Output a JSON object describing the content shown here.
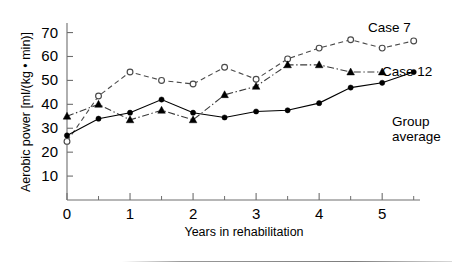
{
  "chart_data": {
    "type": "line",
    "title": "",
    "xlabel": "Years in rehabilitation",
    "ylabel": "Aerobic power [ml/(kg • min)]",
    "xlim": [
      0,
      5.6
    ],
    "ylim": [
      0,
      74
    ],
    "yticks": [
      10,
      20,
      30,
      40,
      50,
      60,
      70
    ],
    "xticks": [
      0,
      1,
      2,
      3,
      4,
      5
    ],
    "x_minor_ticks": [
      0.5,
      1.5,
      2.5,
      3.5,
      4.5,
      5.5
    ],
    "grid": false,
    "legend_position": "inline-right",
    "x": [
      0,
      0.5,
      1,
      1.5,
      2,
      2.5,
      3,
      3.5,
      4,
      4.5,
      5,
      5.5
    ],
    "series": [
      {
        "name": "Case 7",
        "marker": "open-circle",
        "linestyle": "dashed",
        "color": "#4a4a4a",
        "values": [
          24.5,
          43.5,
          53.5,
          50.0,
          48.5,
          55.5,
          50.5,
          59.0,
          63.5,
          67.0,
          63.5,
          66.5
        ]
      },
      {
        "name": "Case 12",
        "marker": "filled-triangle",
        "linestyle": "dash-dot",
        "color": "#3a3a3a",
        "values": [
          35.0,
          40.0,
          33.5,
          37.5,
          33.5,
          44.0,
          47.5,
          56.5,
          56.5,
          53.5,
          53.5,
          null
        ]
      },
      {
        "name": "Group average",
        "marker": "filled-circle",
        "linestyle": "solid",
        "color": "#000000",
        "values": [
          27.0,
          34.0,
          36.5,
          42.0,
          36.5,
          34.5,
          37.0,
          37.5,
          40.5,
          47.0,
          49.0,
          53.5
        ]
      }
    ],
    "annotations": [
      {
        "text": "Case 7",
        "x_px": 368,
        "y_px": 22
      },
      {
        "text": "Case 12",
        "x_px": 382,
        "y_px": 66
      },
      {
        "text": "Group",
        "x_px": 392,
        "y_px": 116
      },
      {
        "text": "average",
        "x_px": 392,
        "y_px": 131
      }
    ]
  },
  "axes": {
    "y_tick_labels": [
      "70",
      "60",
      "50",
      "40",
      "30",
      "20",
      "10"
    ],
    "x_tick_labels": [
      "0",
      "1",
      "2",
      "3",
      "4",
      "5"
    ],
    "y_title": "Aerobic power [ml/(kg • min)]",
    "x_title": "Years in rehabilitation"
  },
  "colors": {
    "axis": "#6e6e6e",
    "ink": "#000000",
    "background": "#ffffff"
  }
}
